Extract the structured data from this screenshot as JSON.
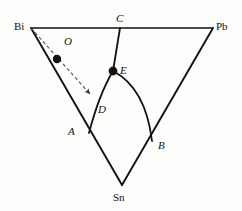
{
  "figure": {
    "kind": "ternary-phase-diagram",
    "background_color": "#fdfdfc",
    "line_color": "#111111",
    "dashed_line_color": "#555555"
  },
  "vertices": {
    "bi": {
      "label": "Bi",
      "x": 31,
      "y": 28
    },
    "pb": {
      "label": "Pb",
      "x": 213,
      "y": 28
    },
    "sn": {
      "label": "Sn",
      "x": 122,
      "y": 185
    }
  },
  "points": {
    "c": {
      "label": "C",
      "x": 120,
      "y": 28
    },
    "e": {
      "label": "E",
      "x": 113,
      "y": 71,
      "marker": "filled-dot"
    },
    "d": {
      "label": "D",
      "x": 102,
      "y": 110
    },
    "a": {
      "label": "A",
      "x": 89,
      "y": 133
    },
    "b": {
      "label": "B",
      "x": 152,
      "y": 141
    },
    "o": {
      "label": "O",
      "x": 57,
      "y": 59,
      "marker": "filled-dot"
    }
  },
  "edges": {
    "bi_pb": "M31,28 L213,28",
    "bi_sn": "M31,28 L122,185",
    "pb_sn": "M213,28 L122,185",
    "c_to_e": "M120,28 L113,71"
  },
  "curves": {
    "e_to_a": "M113,71 C104,86 95,110 89,133",
    "e_to_b": "M113,71 C136,83 148,108 152,141"
  },
  "dashed_arrow": {
    "path": "M31,28 L92,96",
    "from": "Bi",
    "through": "O",
    "head_at": {
      "x": 92,
      "y": 96
    }
  },
  "labels": {
    "bi": "Bi",
    "pb": "Pb",
    "sn": "Sn",
    "c": "C",
    "e": "E",
    "d": "D",
    "a": "A",
    "b": "B",
    "o": "O"
  }
}
